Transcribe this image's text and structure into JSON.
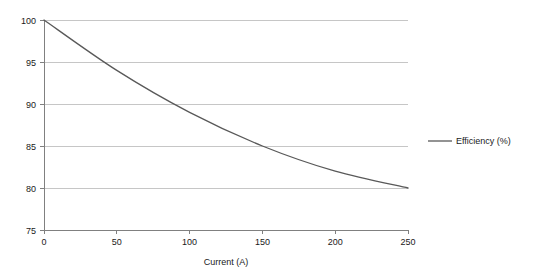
{
  "chart_data": {
    "type": "line",
    "title": "",
    "subtitle": "",
    "xlabel": "Current (A)",
    "ylabel": "",
    "xlim": [
      0,
      250
    ],
    "ylim": [
      75,
      100
    ],
    "xticks": [
      0,
      50,
      100,
      150,
      200,
      250
    ],
    "xtick_labels": [
      "0",
      "50",
      "100",
      "150",
      "200",
      "250"
    ],
    "yticks": [
      75,
      80,
      85,
      90,
      95,
      100
    ],
    "ytick_labels": [
      "75",
      "80",
      "85",
      "90",
      "95",
      "100"
    ],
    "grid": "horizontal",
    "legend_position": "right",
    "x": [
      0,
      50,
      100,
      150,
      200,
      250
    ],
    "series": [
      {
        "name": "Efficiency (%)",
        "color": "#595959",
        "values": [
          100,
          94,
          89,
          85,
          82,
          80
        ]
      }
    ]
  },
  "legend": {
    "entries": [
      {
        "label": "Efficiency (%)",
        "color": "#595959"
      }
    ]
  },
  "axes": {
    "x_title": "Current (A)",
    "y_title": ""
  },
  "colors": {
    "series_line": "#595959",
    "grid": "#b8b8b8",
    "axis": "#808080",
    "text": "#1a1a1a",
    "background": "#ffffff"
  }
}
